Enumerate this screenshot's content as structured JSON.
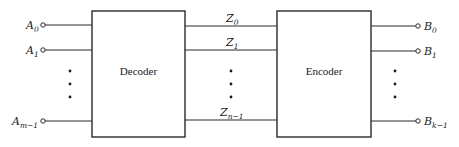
{
  "diagram": {
    "blocks": [
      {
        "id": "decoder",
        "label": "Decoder"
      },
      {
        "id": "encoder",
        "label": "Encoder"
      }
    ],
    "inputs": [
      {
        "base": "A",
        "sub": "0"
      },
      {
        "base": "A",
        "sub": "1"
      },
      {
        "base": "A",
        "sub": "m−1"
      }
    ],
    "intermediate": [
      {
        "base": "Z",
        "sub": "0"
      },
      {
        "base": "Z",
        "sub": "1"
      },
      {
        "base": "Z",
        "sub": "n−1"
      }
    ],
    "outputs": [
      {
        "base": "B",
        "sub": "0"
      },
      {
        "base": "B",
        "sub": "1"
      },
      {
        "base": "B",
        "sub": "k−1"
      }
    ],
    "ellipsis": "⋮"
  }
}
